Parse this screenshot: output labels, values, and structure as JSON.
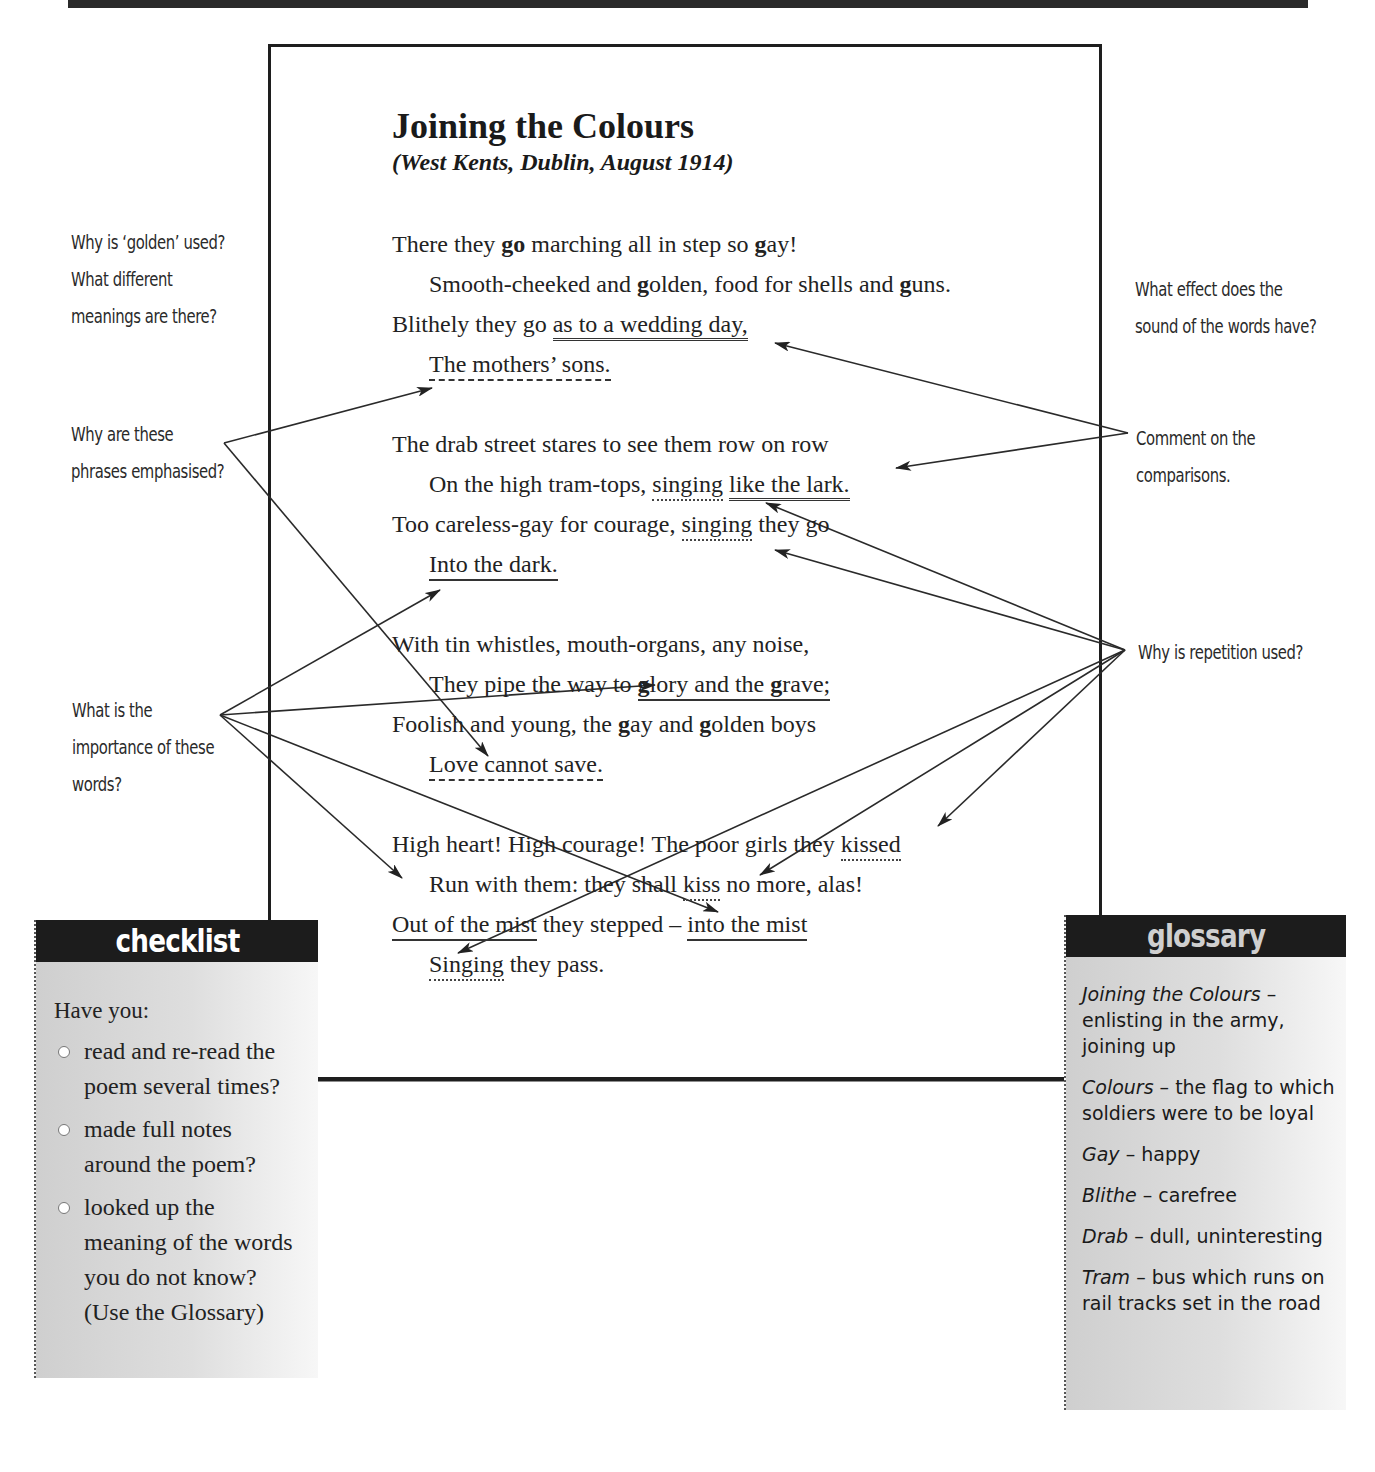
{
  "poem": {
    "title": "Joining the Colours",
    "subtitle": "(West Kents, Dublin, August 1914)",
    "stanzas": [
      {
        "lines": [
          {
            "pre": "There they ",
            "b1": "go",
            "mid": " marching all in step so ",
            "b2": "g",
            "post": "ay!"
          },
          {
            "pre": "Smooth-cheeked and ",
            "b1": "g",
            "mid": "olden, food for shells and ",
            "b2": "g",
            "post": "uns."
          },
          {
            "pre": "Blithely they go ",
            "u": "as to a wedding day,"
          },
          {
            "u": "The mothers’ sons."
          }
        ]
      },
      {
        "lines": [
          {
            "pre": "The drab street stares to see them row on row"
          },
          {
            "pre": "On the high tram-tops, ",
            "dot": "singing",
            "sp": " ",
            "u": "like the lark."
          },
          {
            "pre": "Too careless-gay for courage, ",
            "dot": "singing",
            "post": " they go"
          },
          {
            "u": "Into the dark."
          }
        ]
      },
      {
        "lines": [
          {
            "pre": "With tin whistles, mouth-organs, any noise,"
          },
          {
            "pre": "They pipe the way to ",
            "u1": "g",
            "u2": "lory and the ",
            "u3": "g",
            "u4": "rave;"
          },
          {
            "pre": "Foolish and young, the ",
            "b1": "g",
            "mid": "ay and ",
            "b2": "g",
            "post": "olden boys"
          },
          {
            "u": "Love cannot save."
          }
        ]
      },
      {
        "lines": [
          {
            "pre": "High heart! High courage! The poor girls they ",
            "dot": "kissed"
          },
          {
            "pre": "Run with them: they shall ",
            "dot": "kiss",
            "post": " no more, alas!"
          },
          {
            "u": "Out of the mist",
            "mid": " they stepped – ",
            "u2": "into the mist"
          },
          {
            "dot": "Singing",
            "post": " they pass."
          }
        ]
      }
    ]
  },
  "annotations": {
    "golden": [
      "Why is ‘golden’ used?",
      "What different",
      "meanings are there?"
    ],
    "emphasised": [
      "Why are these",
      "phrases emphasised?"
    ],
    "importance": [
      "What is the",
      "importance of these",
      "words?"
    ],
    "sound": [
      "What effect does the",
      "sound of the words have?"
    ],
    "comparisons": [
      "Comment on the",
      "comparisons."
    ],
    "repetition": [
      "Why is repetition used?"
    ]
  },
  "checklist": {
    "header": "checklist",
    "intro": "Have you:",
    "items": [
      [
        "read and re-read the",
        "poem several times?"
      ],
      [
        "made full notes",
        "around the poem?"
      ],
      [
        "looked up the",
        "meaning of the words",
        "you do not know?",
        "(Use the Glossary)"
      ]
    ]
  },
  "glossary": {
    "header": "glossary",
    "items": [
      {
        "term": "Joining the Colours",
        "def": " – enlisting in the army, joining up"
      },
      {
        "term": "Colours",
        "def": " – the flag to which soldiers were to be loyal"
      },
      {
        "term": "Gay",
        "def": " – happy"
      },
      {
        "term": "Blithe",
        "def": " – carefree"
      },
      {
        "term": "Drab",
        "def": " – dull, uninteresting"
      },
      {
        "term": "Tram",
        "def": " – bus which runs on rail tracks set in the road"
      }
    ]
  },
  "colors": {
    "ink": "#222222",
    "header_bg": "#1c1c1c",
    "box_bg": "#d6d6d6"
  }
}
